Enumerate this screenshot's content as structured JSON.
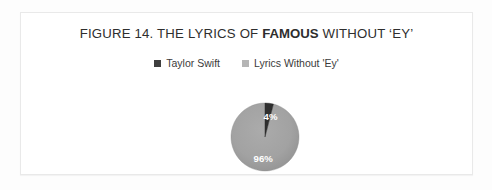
{
  "figure": {
    "frame_border_color": "#e9e9e9",
    "background_color": "#fdfdfd",
    "canvas_color": "#ffffff"
  },
  "title": {
    "part1": "FIGURE 14. THE LYRICS OF ",
    "emphasis": "FAMOUS",
    "part2": " WITHOUT ‘EY’",
    "color": "#2e2e2e"
  },
  "legend": {
    "position": "top",
    "items": [
      {
        "label": "Taylor Swift",
        "color": "#3f3f3f"
      },
      {
        "label": "Lyrics Without 'Ey'",
        "color": "#b5b5b5"
      }
    ]
  },
  "chart_data": {
    "type": "pie",
    "title": "FIGURE 14. THE LYRICS OF FAMOUS WITHOUT ‘EY’",
    "xlabel": "",
    "ylabel": "",
    "categories": [
      "Taylor Swift",
      "Lyrics Without 'Ey'"
    ],
    "values": [
      4,
      96
    ],
    "value_unit": "%",
    "data_labels": [
      "4%",
      "96%"
    ],
    "colors": [
      "#3f3f3f",
      "#a0a0a0"
    ],
    "legend_position": "top",
    "grid": false,
    "start_angle_deg": 0,
    "label_color": "#ffffff"
  }
}
